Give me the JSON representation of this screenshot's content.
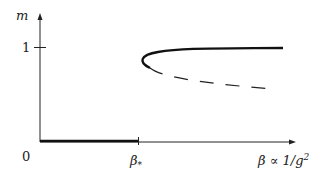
{
  "diagram": {
    "y_axis_label": "m",
    "y_tick_label": "1",
    "origin_label": "0",
    "x_tick_label": "β",
    "x_tick_subscript": "*",
    "x_axis_label": "β ∝ 1/g",
    "x_axis_label_superscript": "2",
    "curves": [
      {
        "name": "zero-branch",
        "style": "thick-solid",
        "from_x": "0",
        "to_x": "β*",
        "m": 0
      },
      {
        "name": "stable-branch",
        "style": "thick-solid",
        "description": "upper branch approaching m=1"
      },
      {
        "name": "unstable-branch",
        "style": "dashed",
        "description": "lower branch decreasing"
      }
    ]
  }
}
